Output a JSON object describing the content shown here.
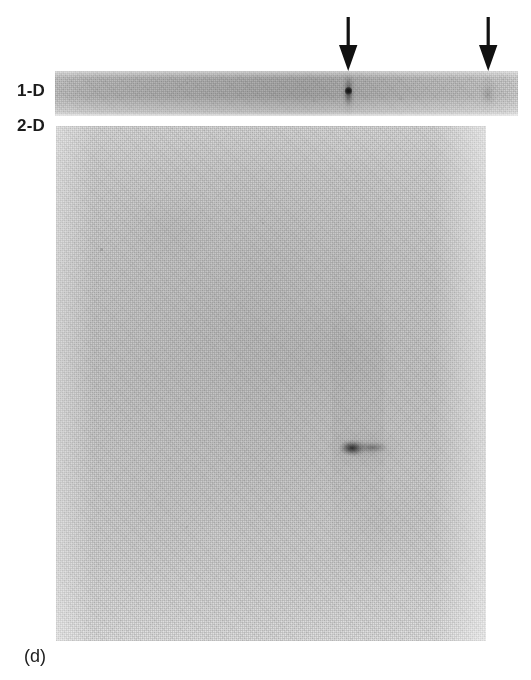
{
  "figure": {
    "panel_letter": "(d)",
    "type": "autoradiograph"
  },
  "labels": {
    "one_d": "1-D",
    "two_d": "2-D"
  },
  "annotations": {
    "arrows": [
      {
        "name": "arrow-left",
        "direction": "down",
        "x": 348,
        "points_to": "major-spot-1d"
      },
      {
        "name": "arrow-right",
        "direction": "down",
        "x": 488,
        "points_to": "minor-band-1d"
      }
    ]
  },
  "panels": {
    "one_d_strip": {
      "name": "1-D",
      "x": 55,
      "y": 71,
      "width": 463,
      "height": 45,
      "base_color": "#b5b5b5",
      "features": [
        {
          "name": "major-spot",
          "x": 348,
          "y": 90,
          "intensity": "strong",
          "shape": "vertical-streak-with-dark-core"
        },
        {
          "name": "minor-band",
          "x": 488,
          "y": 90,
          "intensity": "faint",
          "shape": "diffuse-band"
        }
      ]
    },
    "two_d_gel": {
      "name": "2-D",
      "x": 56,
      "y": 126,
      "width": 430,
      "height": 515,
      "base_color": "#d0d0d0",
      "features": [
        {
          "name": "resolved-spot",
          "x": 355,
          "y": 448,
          "intensity": "strong",
          "shape": "elongated-horizontal-smear"
        }
      ]
    }
  },
  "colors": {
    "background": "#ffffff",
    "ink": "#1c1c1c",
    "strip_gray": "#b5b5b5",
    "gel_gray": "#d0d0d0",
    "spot_dark": "#141414"
  }
}
